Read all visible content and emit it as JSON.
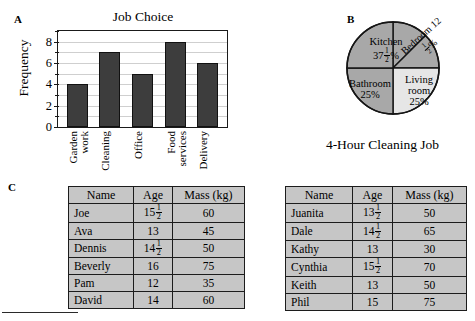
{
  "panels": {
    "a_letter": "A",
    "b_letter": "B",
    "c_letter": "C"
  },
  "bar_chart": {
    "title": "Job Choice",
    "ylabel": "Frequency"
  },
  "pie_chart": {
    "caption": "4-Hour Cleaning Job",
    "labels": {
      "kitchen_name": "Kitchen",
      "kitchen_value_int": "37",
      "kitchen_num": "1",
      "kitchen_den": "2",
      "kitchen_pct": "%",
      "bedroom_name": "Bedroom",
      "bedroom_value_int": "12",
      "bedroom_num": "1",
      "bedroom_den": "2",
      "bedroom_pct": "%",
      "living_name_1": "Living",
      "living_name_2": "room",
      "living_value": "25%",
      "bathroom_name": "Bathroom",
      "bathroom_value": "25%"
    }
  },
  "tables": {
    "headers": [
      "Name",
      "Age",
      "Mass (kg)"
    ],
    "left": [
      {
        "name": "Joe",
        "age": "15",
        "age_num": "1",
        "age_den": "2",
        "mass": "60"
      },
      {
        "name": "Ava",
        "age": "13",
        "age_num": "",
        "age_den": "",
        "mass": "45"
      },
      {
        "name": "Dennis",
        "age": "14",
        "age_num": "1",
        "age_den": "2",
        "mass": "50"
      },
      {
        "name": "Beverly",
        "age": "16",
        "age_num": "",
        "age_den": "",
        "mass": "75"
      },
      {
        "name": "Pam",
        "age": "12",
        "age_num": "",
        "age_den": "",
        "mass": "35"
      },
      {
        "name": "David",
        "age": "14",
        "age_num": "",
        "age_den": "",
        "mass": "60"
      }
    ],
    "right": [
      {
        "name": "Juanita",
        "age": "13",
        "age_num": "1",
        "age_den": "2",
        "mass": "50"
      },
      {
        "name": "Dale",
        "age": "14",
        "age_num": "1",
        "age_den": "2",
        "mass": "65"
      },
      {
        "name": "Kathy",
        "age": "13",
        "age_num": "",
        "age_den": "",
        "mass": "30"
      },
      {
        "name": "Cynthia",
        "age": "15",
        "age_num": "1",
        "age_den": "2",
        "mass": "70"
      },
      {
        "name": "Keith",
        "age": "13",
        "age_num": "",
        "age_den": "",
        "mass": "50"
      },
      {
        "name": "Phil",
        "age": "15",
        "age_num": "",
        "age_den": "",
        "mass": "75"
      }
    ]
  },
  "chart_data": [
    {
      "type": "bar",
      "title": "Job Choice",
      "xlabel": "",
      "ylabel": "Frequency",
      "categories": [
        "Garden work",
        "Cleaning",
        "Office",
        "Food services",
        "Delivery"
      ],
      "category_lines": [
        [
          "Garden",
          "work"
        ],
        [
          "Cleaning"
        ],
        [
          "Office"
        ],
        [
          "Food",
          "services"
        ],
        [
          "Delivery"
        ]
      ],
      "values": [
        4,
        7,
        5,
        8,
        6
      ],
      "ylim": [
        0,
        9
      ],
      "yticks": [
        0,
        1,
        2,
        3,
        4,
        5,
        6,
        7,
        8,
        9
      ],
      "ytick_labels": [
        "0",
        "",
        "2",
        "",
        "4",
        "",
        "6",
        "",
        "8",
        ""
      ],
      "grid": true,
      "legend": "none",
      "bar_color": "#3d3d3d"
    },
    {
      "type": "pie",
      "title": "4-Hour Cleaning Job",
      "labels": [
        "Kitchen",
        "Bedroom",
        "Living room",
        "Bathroom"
      ],
      "values": [
        37.5,
        12.5,
        25,
        25
      ],
      "value_labels": [
        "37 1/2 %",
        "12 1/2 %",
        "25%",
        "25%"
      ],
      "colors": [
        "#a8a8a8",
        "#a8a8a8",
        "#e4e4e4",
        "#a8a8a8"
      ],
      "legend": "none"
    },
    {
      "type": "table",
      "title": "",
      "columns": [
        "Name",
        "Age",
        "Mass (kg)"
      ],
      "rows": [
        [
          "Joe",
          "15 1/2",
          "60"
        ],
        [
          "Ava",
          "13",
          "45"
        ],
        [
          "Dennis",
          "14 1/2",
          "50"
        ],
        [
          "Beverly",
          "16",
          "75"
        ],
        [
          "Pam",
          "12",
          "35"
        ],
        [
          "David",
          "14",
          "60"
        ]
      ]
    },
    {
      "type": "table",
      "title": "",
      "columns": [
        "Name",
        "Age",
        "Mass (kg)"
      ],
      "rows": [
        [
          "Juanita",
          "13 1/2",
          "50"
        ],
        [
          "Dale",
          "14 1/2",
          "65"
        ],
        [
          "Kathy",
          "13",
          "30"
        ],
        [
          "Cynthia",
          "15 1/2",
          "70"
        ],
        [
          "Keith",
          "13",
          "50"
        ],
        [
          "Phil",
          "15",
          "75"
        ]
      ]
    }
  ]
}
